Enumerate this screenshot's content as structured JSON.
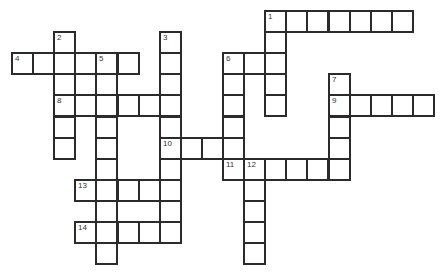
{
  "puzzle": {
    "type": "crossword",
    "cell_size_px": 21.1,
    "origin": {
      "x": 11,
      "y": 10
    },
    "entries": [
      {
        "number": "1",
        "direction": "across",
        "row": 0,
        "col": 12,
        "length": 7
      },
      {
        "number": "1",
        "direction": "down",
        "row": 0,
        "col": 12,
        "length": 5
      },
      {
        "number": "2",
        "direction": "down",
        "row": 1,
        "col": 2,
        "length": 6
      },
      {
        "number": "3",
        "direction": "down",
        "row": 1,
        "col": 7,
        "length": 10
      },
      {
        "number": "4",
        "direction": "across",
        "row": 2,
        "col": 0,
        "length": 6
      },
      {
        "number": "5",
        "direction": "down",
        "row": 2,
        "col": 4,
        "length": 10
      },
      {
        "number": "6",
        "direction": "across",
        "row": 2,
        "col": 10,
        "length": 3
      },
      {
        "number": "6",
        "direction": "down",
        "row": 2,
        "col": 10,
        "length": 6
      },
      {
        "number": "7",
        "direction": "down",
        "row": 3,
        "col": 15,
        "length": 5
      },
      {
        "number": "8",
        "direction": "across",
        "row": 4,
        "col": 2,
        "length": 6
      },
      {
        "number": "9",
        "direction": "across",
        "row": 4,
        "col": 15,
        "length": 5
      },
      {
        "number": "10",
        "direction": "across",
        "row": 6,
        "col": 7,
        "length": 4
      },
      {
        "number": "11",
        "direction": "across",
        "row": 7,
        "col": 10,
        "length": 6
      },
      {
        "number": "12",
        "direction": "down",
        "row": 7,
        "col": 11,
        "length": 5
      },
      {
        "number": "13",
        "direction": "across",
        "row": 8,
        "col": 3,
        "length": 5
      },
      {
        "number": "14",
        "direction": "across",
        "row": 10,
        "col": 3,
        "length": 5
      }
    ],
    "extra_cells": [
      {
        "row": 3,
        "col": 3
      }
    ],
    "numbers": [
      {
        "label": "1",
        "row": 0,
        "col": 12
      },
      {
        "label": "2",
        "row": 1,
        "col": 2
      },
      {
        "label": "3",
        "row": 1,
        "col": 7
      },
      {
        "label": "4",
        "row": 2,
        "col": 0
      },
      {
        "label": "5",
        "row": 2,
        "col": 4
      },
      {
        "label": "6",
        "row": 2,
        "col": 10
      },
      {
        "label": "7",
        "row": 3,
        "col": 15
      },
      {
        "label": "8",
        "row": 4,
        "col": 2
      },
      {
        "label": "9",
        "row": 4,
        "col": 15
      },
      {
        "label": "10",
        "row": 6,
        "col": 7
      },
      {
        "label": "11",
        "row": 7,
        "col": 10
      },
      {
        "label": "12",
        "row": 7,
        "col": 11
      },
      {
        "label": "13",
        "row": 8,
        "col": 3
      },
      {
        "label": "14",
        "row": 10,
        "col": 3
      }
    ]
  },
  "colors": {
    "border": "#2b2b2b",
    "cell_fill": "#ffffff",
    "number_text": "#333333"
  }
}
